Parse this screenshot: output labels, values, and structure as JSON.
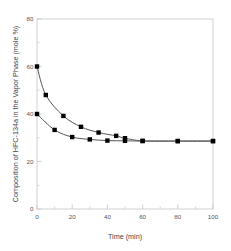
{
  "chart_data": {
    "type": "line",
    "title": "",
    "xlabel": "Time (min)",
    "ylabel": "Composition of HFC-134a in the Vapor Phase (mole %)",
    "xlim": [
      0,
      100
    ],
    "ylim": [
      0,
      80
    ],
    "xticks": [
      0,
      20,
      40,
      60,
      80,
      100
    ],
    "yticks": [
      0,
      20,
      40,
      60,
      80
    ],
    "xtick_labels": [
      "0",
      "20",
      "40",
      "60",
      "80",
      "100"
    ],
    "ytick_labels": [
      "0",
      "20",
      "40",
      "60",
      "80"
    ],
    "x_minor_ticks": [
      10,
      30,
      50,
      70,
      90
    ],
    "y_minor_ticks": [
      10,
      30,
      50,
      70
    ],
    "grid": false,
    "legend": false,
    "legend_position": "none",
    "marker": "filled-square",
    "marker_color": "#000000",
    "line_color": "#555555",
    "frame_color": "#cccccc",
    "series": [
      {
        "name": "upper-curve",
        "points": [
          {
            "x": 0,
            "y": 60.0
          },
          {
            "x": 5,
            "y": 48.0
          },
          {
            "x": 15,
            "y": 39.2
          },
          {
            "x": 25,
            "y": 34.6
          },
          {
            "x": 35,
            "y": 32.2
          },
          {
            "x": 45,
            "y": 30.8
          },
          {
            "x": 50,
            "y": 29.8
          },
          {
            "x": 60,
            "y": 28.7
          },
          {
            "x": 80,
            "y": 28.6
          },
          {
            "x": 100,
            "y": 28.6
          }
        ]
      },
      {
        "name": "lower-curve",
        "points": [
          {
            "x": 0,
            "y": 40.0
          },
          {
            "x": 10,
            "y": 33.3
          },
          {
            "x": 20,
            "y": 30.3
          },
          {
            "x": 30,
            "y": 29.3
          },
          {
            "x": 40,
            "y": 28.8
          },
          {
            "x": 50,
            "y": 28.7
          },
          {
            "x": 60,
            "y": 28.6
          },
          {
            "x": 80,
            "y": 28.6
          },
          {
            "x": 100,
            "y": 28.6
          }
        ]
      }
    ]
  }
}
